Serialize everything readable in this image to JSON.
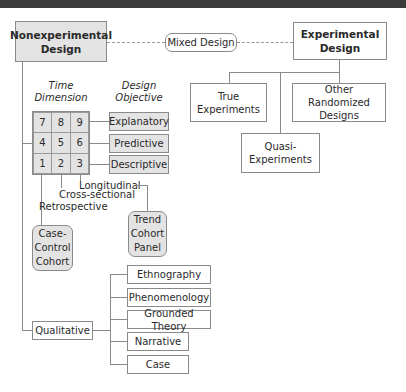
{
  "diagram": {
    "nonexperimental": {
      "line1": "Nonexperimental",
      "line2": "Design"
    },
    "mixed": "Mixed Design",
    "experimental": {
      "line1": "Experimental",
      "line2": "Design"
    },
    "experimental_children": {
      "true_experiments": {
        "line1": "True",
        "line2": "Experiments"
      },
      "other_randomized": {
        "line1": "Other Randomized",
        "line2": "Designs"
      },
      "quasi": {
        "line1": "Quasi-",
        "line2": "Experiments"
      }
    },
    "time_dimension": {
      "line1": "Time",
      "line2": "Dimension"
    },
    "design_objective": {
      "line1": "Design",
      "line2": "Objective"
    },
    "grid_cells": [
      "7",
      "8",
      "9",
      "4",
      "5",
      "6",
      "1",
      "2",
      "3"
    ],
    "objectives": [
      "Explanatory",
      "Predictive",
      "Descriptive"
    ],
    "time_labels": {
      "longitudinal": "Longitudinal",
      "cross_sectional": "Cross-sectional",
      "retrospective": "Retrospective"
    },
    "retrospective_box": {
      "line1": "Case-",
      "line2": "Control",
      "line3": "Cohort"
    },
    "longitudinal_box": {
      "line1": "Trend",
      "line2": "Cohort",
      "line3": "Panel"
    },
    "qualitative": "Qualitative",
    "qualitative_types": [
      "Ethnography",
      "Phenomenology",
      "Grounded Theory",
      "Narrative",
      "Case"
    ]
  },
  "colors": {
    "box_gray": "#e3e3e3",
    "line": "#8a8a8a",
    "topbar": "#3b3b3b"
  }
}
